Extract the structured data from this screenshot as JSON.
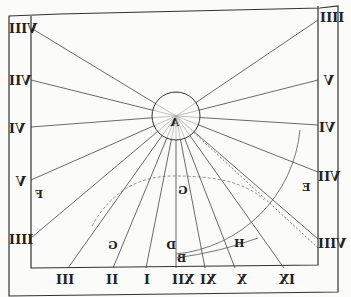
{
  "diagram": {
    "type": "vertical sundial (mirrored engraving)",
    "center_label": "A",
    "left_hour_labels": [
      "VIII",
      "VII",
      "VI",
      "V",
      "IIII"
    ],
    "right_hour_labels": [
      "IIII",
      "V",
      "VI",
      "VII",
      "VIII"
    ],
    "bottom_hour_labels": [
      "III",
      "II",
      "I",
      "XII",
      "XI",
      "X",
      "IX"
    ],
    "point_labels": {
      "left": "F",
      "right": "E",
      "arc_top": "G",
      "arc_left": "G",
      "below_center": "D",
      "base": "B",
      "arc_right": "H"
    }
  }
}
